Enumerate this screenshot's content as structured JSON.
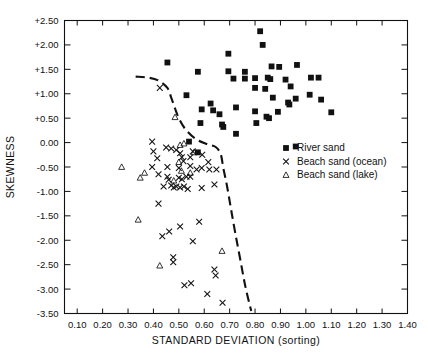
{
  "chart_data": {
    "type": "scatter",
    "title": "",
    "xlabel": "STANDARD DEVIATION (sorting)",
    "ylabel": "SKEWNESS",
    "xlim": [
      0.05,
      1.4
    ],
    "ylim": [
      -3.5,
      2.5
    ],
    "grid": false,
    "legend_position": "right-middle",
    "xticks": [
      "0.10",
      "0.20",
      "0.30",
      "0.40",
      "0.50",
      "0.60",
      "0.70",
      "0.80",
      "0.90",
      "1.00",
      "1.10",
      "1.20",
      "1.30",
      "1.40"
    ],
    "xtick_values": [
      0.1,
      0.2,
      0.3,
      0.4,
      0.5,
      0.6,
      0.7,
      0.8,
      0.9,
      1.0,
      1.1,
      1.2,
      1.3,
      1.4
    ],
    "yticks": [
      "+2.50",
      "+2.00",
      "+1.50",
      "+1.00",
      "+0.50",
      "0.00",
      "-0.50",
      "-1.00",
      "-1.50",
      "-2.00",
      "-2.50",
      "-3.00",
      "-3.50"
    ],
    "ytick_values": [
      2.5,
      2.0,
      1.5,
      1.0,
      0.5,
      0.0,
      -0.5,
      -1.0,
      -1.5,
      -2.0,
      -2.5,
      -3.0,
      -3.5
    ],
    "legend": [
      {
        "label": "River sand",
        "marker": "square"
      },
      {
        "label": "Beach sand (ocean)",
        "marker": "x"
      },
      {
        "label": "Beach sand (lake)",
        "marker": "triangle"
      }
    ],
    "annotations": [
      {
        "text": "dashed discriminant curve separating river sand from beach sand",
        "type": "curve"
      }
    ],
    "curve": [
      [
        0.33,
        1.35
      ],
      [
        0.38,
        1.33
      ],
      [
        0.42,
        1.27
      ],
      [
        0.455,
        1.12
      ],
      [
        0.47,
        0.92
      ],
      [
        0.485,
        0.7
      ],
      [
        0.5,
        0.5
      ],
      [
        0.525,
        0.28
      ],
      [
        0.565,
        0.08
      ],
      [
        0.61,
        -0.03
      ],
      [
        0.645,
        -0.09
      ],
      [
        0.665,
        -0.24
      ],
      [
        0.675,
        -0.52
      ],
      [
        0.69,
        -0.9
      ],
      [
        0.705,
        -1.35
      ],
      [
        0.722,
        -1.85
      ],
      [
        0.742,
        -2.4
      ],
      [
        0.762,
        -2.95
      ],
      [
        0.785,
        -3.45
      ]
    ],
    "series": [
      {
        "name": "River sand",
        "marker": "square",
        "points": [
          [
            0.455,
            1.64
          ],
          [
            0.575,
            1.45
          ],
          [
            0.695,
            1.82
          ],
          [
            0.695,
            1.46
          ],
          [
            0.76,
            1.45
          ],
          [
            0.715,
            1.31
          ],
          [
            0.76,
            1.31
          ],
          [
            0.53,
            0.97
          ],
          [
            0.625,
            0.8
          ],
          [
            0.59,
            0.68
          ],
          [
            0.635,
            0.66
          ],
          [
            0.66,
            0.58
          ],
          [
            0.585,
            0.4
          ],
          [
            0.67,
            0.37
          ],
          [
            0.675,
            0.32
          ],
          [
            0.54,
            0.02
          ],
          [
            0.575,
            -0.2
          ],
          [
            0.82,
            2.28
          ],
          [
            0.83,
            2.0
          ],
          [
            0.865,
            1.56
          ],
          [
            0.895,
            1.55
          ],
          [
            0.965,
            1.59
          ],
          [
            0.8,
            1.32
          ],
          [
            0.85,
            1.33
          ],
          [
            0.86,
            1.3
          ],
          [
            0.92,
            1.29
          ],
          [
            1.02,
            1.33
          ],
          [
            1.05,
            1.33
          ],
          [
            0.8,
            1.12
          ],
          [
            0.84,
            1.1
          ],
          [
            0.94,
            1.15
          ],
          [
            1.015,
            0.98
          ],
          [
            0.87,
            0.92
          ],
          [
            0.96,
            0.9
          ],
          [
            0.93,
            0.82
          ],
          [
            0.935,
            0.78
          ],
          [
            1.06,
            0.88
          ],
          [
            0.8,
            0.64
          ],
          [
            0.89,
            0.63
          ],
          [
            0.845,
            0.53
          ],
          [
            0.855,
            0.5
          ],
          [
            0.805,
            0.4
          ],
          [
            1.1,
            0.62
          ],
          [
            0.725,
            0.72
          ],
          [
            0.96,
            -0.08
          ],
          [
            0.725,
            0.18
          ]
        ]
      },
      {
        "name": "Beach sand (ocean)",
        "marker": "x",
        "points": [
          [
            0.425,
            1.12
          ],
          [
            0.395,
            0.02
          ],
          [
            0.4,
            -0.18
          ],
          [
            0.415,
            -0.32
          ],
          [
            0.395,
            -0.5
          ],
          [
            0.455,
            -0.5
          ],
          [
            0.5,
            -0.52
          ],
          [
            0.545,
            -0.48
          ],
          [
            0.57,
            -0.55
          ],
          [
            0.59,
            -0.52
          ],
          [
            0.62,
            -0.55
          ],
          [
            0.42,
            -0.65
          ],
          [
            0.455,
            -0.7
          ],
          [
            0.46,
            -0.76
          ],
          [
            0.5,
            -0.72
          ],
          [
            0.512,
            -0.75
          ],
          [
            0.53,
            -0.7
          ],
          [
            0.545,
            -0.7
          ],
          [
            0.47,
            -0.88
          ],
          [
            0.48,
            -0.92
          ],
          [
            0.49,
            -0.9
          ],
          [
            0.505,
            -0.92
          ],
          [
            0.52,
            -0.9
          ],
          [
            0.535,
            -0.95
          ],
          [
            0.44,
            -0.9
          ],
          [
            0.59,
            -0.93
          ],
          [
            0.42,
            -1.25
          ],
          [
            0.45,
            -0.1
          ],
          [
            0.47,
            -0.12
          ],
          [
            0.49,
            -0.15
          ],
          [
            0.505,
            -0.22
          ],
          [
            0.512,
            -0.3
          ],
          [
            0.518,
            -0.38
          ],
          [
            0.545,
            -0.3
          ],
          [
            0.555,
            -0.18
          ],
          [
            0.592,
            -0.25
          ],
          [
            0.616,
            -0.4
          ],
          [
            0.648,
            -0.55
          ],
          [
            0.64,
            -0.86
          ],
          [
            0.435,
            -1.92
          ],
          [
            0.462,
            -1.82
          ],
          [
            0.58,
            -1.62
          ],
          [
            0.478,
            -2.35
          ],
          [
            0.478,
            -2.45
          ],
          [
            0.522,
            -2.92
          ],
          [
            0.548,
            -2.88
          ],
          [
            0.64,
            -2.6
          ],
          [
            0.645,
            -2.72
          ],
          [
            0.612,
            -3.1
          ],
          [
            0.672,
            -3.28
          ],
          [
            0.555,
            -2.02
          ],
          [
            0.505,
            -1.72
          ]
        ]
      },
      {
        "name": "Beach sand (lake)",
        "marker": "triangle",
        "points": [
          [
            0.485,
            0.52
          ],
          [
            0.275,
            -0.5
          ],
          [
            0.365,
            -0.62
          ],
          [
            0.51,
            -0.58
          ],
          [
            0.545,
            -0.62
          ],
          [
            0.48,
            -0.78
          ],
          [
            0.34,
            -1.58
          ],
          [
            0.67,
            -2.22
          ],
          [
            0.425,
            -2.52
          ],
          [
            0.5,
            -0.4
          ],
          [
            0.505,
            -0.05
          ],
          [
            0.52,
            -0.02
          ],
          [
            0.56,
            -0.2
          ],
          [
            0.348,
            -0.72
          ]
        ]
      }
    ]
  }
}
